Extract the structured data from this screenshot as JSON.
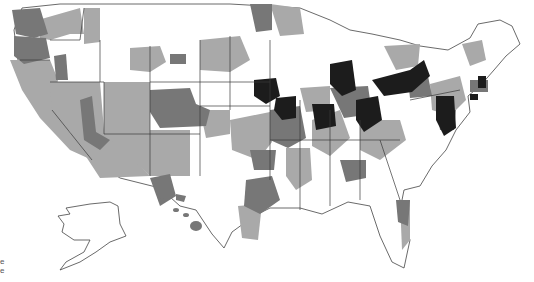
{
  "map": {
    "type": "choropleth",
    "region": "United States (contiguous + Alaska + Hawaii)",
    "classes": [
      {
        "name": "none",
        "color": "#ffffff"
      },
      {
        "name": "low",
        "color": "#a9a9a9"
      },
      {
        "name": "medium",
        "color": "#777777"
      },
      {
        "name": "high",
        "color": "#1c1c1c"
      }
    ],
    "border_color": "#3a3a3a"
  },
  "legend": {
    "items": [
      "e",
      "e"
    ]
  }
}
